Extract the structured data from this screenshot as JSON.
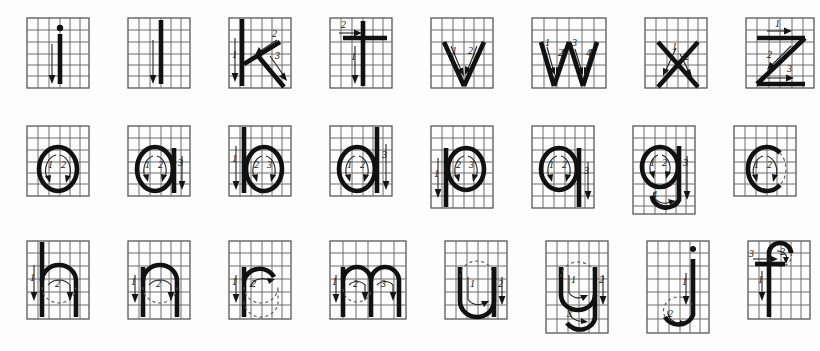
{
  "document": {
    "title": "Lowercase Letter Stroke-Order Chart",
    "description": "Handwriting practice sheet showing stroke order and direction for lowercase letters on square grids",
    "background_color": "#fdfdfd",
    "grid_line_color": "#6d6d6d",
    "stroke_color": "#111111",
    "ghost_color": "#555555",
    "grid_columns": 6,
    "grid_rows": 6
  },
  "rows": [
    {
      "row_label": "row-1",
      "cells": [
        {
          "letter": "i",
          "stroke_numbers": [
            "1"
          ],
          "stroke_count": 1,
          "has_dot": true
        },
        {
          "letter": "l",
          "stroke_numbers": [
            "1"
          ],
          "stroke_count": 1,
          "has_dot": false
        },
        {
          "letter": "k",
          "stroke_numbers": [
            "1",
            "2",
            "3"
          ],
          "stroke_count": 3,
          "has_dot": false
        },
        {
          "letter": "t",
          "stroke_numbers": [
            "1",
            "2"
          ],
          "stroke_count": 2,
          "has_dot": false
        },
        {
          "letter": "v",
          "stroke_numbers": [
            "1",
            "2"
          ],
          "stroke_count": 2,
          "has_dot": false
        },
        {
          "letter": "w",
          "stroke_numbers": [
            "1",
            "2",
            "3",
            "4"
          ],
          "stroke_count": 4,
          "has_dot": false
        },
        {
          "letter": "x",
          "stroke_numbers": [
            "1",
            "2"
          ],
          "stroke_count": 2,
          "has_dot": false
        },
        {
          "letter": "z",
          "stroke_numbers": [
            "1",
            "2",
            "3"
          ],
          "stroke_count": 3,
          "has_dot": false
        }
      ]
    },
    {
      "row_label": "row-2",
      "cells": [
        {
          "letter": "o",
          "stroke_numbers": [
            "1",
            "2"
          ],
          "stroke_count": 2,
          "has_dot": false
        },
        {
          "letter": "a",
          "stroke_numbers": [
            "1",
            "2",
            "3"
          ],
          "stroke_count": 3,
          "has_dot": false
        },
        {
          "letter": "b",
          "stroke_numbers": [
            "1",
            "2",
            "3"
          ],
          "stroke_count": 3,
          "has_dot": false
        },
        {
          "letter": "d",
          "stroke_numbers": [
            "1",
            "2",
            "3"
          ],
          "stroke_count": 3,
          "has_dot": false
        },
        {
          "letter": "p",
          "stroke_numbers": [
            "1",
            "2",
            "3"
          ],
          "stroke_count": 3,
          "has_dot": false
        },
        {
          "letter": "q",
          "stroke_numbers": [
            "1",
            "2",
            "3"
          ],
          "stroke_count": 3,
          "has_dot": false
        },
        {
          "letter": "g",
          "stroke_numbers": [
            "1",
            "2",
            "3",
            "4"
          ],
          "stroke_count": 4,
          "has_dot": false
        },
        {
          "letter": "c",
          "stroke_numbers": [
            "1",
            "2"
          ],
          "stroke_count": 2,
          "has_dot": false
        },
        {
          "letter": "e",
          "stroke_numbers": [
            "1",
            "2"
          ],
          "stroke_count": 2,
          "has_dot": false
        }
      ]
    },
    {
      "row_label": "row-3",
      "cells": [
        {
          "letter": "h",
          "stroke_numbers": [
            "1",
            "2"
          ],
          "stroke_count": 2,
          "has_dot": false
        },
        {
          "letter": "n",
          "stroke_numbers": [
            "1",
            "2"
          ],
          "stroke_count": 2,
          "has_dot": false
        },
        {
          "letter": "r",
          "stroke_numbers": [
            "1",
            "2"
          ],
          "stroke_count": 2,
          "has_dot": false
        },
        {
          "letter": "m",
          "stroke_numbers": [
            "1",
            "2",
            "3"
          ],
          "stroke_count": 3,
          "has_dot": false
        },
        {
          "letter": "u",
          "stroke_numbers": [
            "1",
            "2"
          ],
          "stroke_count": 2,
          "has_dot": false
        },
        {
          "letter": "y",
          "stroke_numbers": [
            "1",
            "2",
            "3"
          ],
          "stroke_count": 3,
          "has_dot": false
        },
        {
          "letter": "j",
          "stroke_numbers": [
            "1",
            "2"
          ],
          "stroke_count": 2,
          "has_dot": true
        },
        {
          "letter": "f",
          "stroke_numbers": [
            "1",
            "2",
            "3"
          ],
          "stroke_count": 3,
          "has_dot": false
        },
        {
          "letter": "s",
          "stroke_numbers": [
            "1",
            "2",
            "3"
          ],
          "stroke_count": 3,
          "has_dot": false
        }
      ]
    }
  ]
}
